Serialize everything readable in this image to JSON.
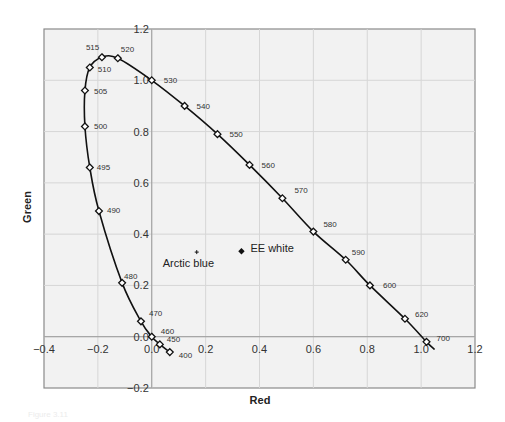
{
  "chart_data": {
    "type": "line",
    "title": "",
    "xlabel": "Red",
    "ylabel": "Green",
    "xlim": [
      -0.4,
      1.2
    ],
    "ylim": [
      -0.2,
      1.2
    ],
    "grid": true,
    "x_ticks": [
      "-0.4",
      "-0.2",
      "0.0",
      "0.2",
      "0.4",
      "0.6",
      "0.8",
      "1.0",
      "1.2"
    ],
    "y_ticks": [
      "-0.2",
      "0.0",
      "0.2",
      "0.4",
      "0.6",
      "0.8",
      "1.0",
      "1.2"
    ],
    "series": [
      {
        "name": "Spectral locus",
        "marker": "diamond-open",
        "points": [
          {
            "label": "400",
            "x": 0.067,
            "y": -0.06
          },
          {
            "label": "450",
            "x": 0.03,
            "y": -0.03
          },
          {
            "label": "460",
            "x": 0.0,
            "y": 0.0
          },
          {
            "label": "470",
            "x": -0.04,
            "y": 0.06
          },
          {
            "label": "480",
            "x": -0.11,
            "y": 0.21
          },
          {
            "label": "490",
            "x": -0.196,
            "y": 0.49
          },
          {
            "label": "495",
            "x": -0.23,
            "y": 0.66
          },
          {
            "label": "500",
            "x": -0.248,
            "y": 0.82
          },
          {
            "label": "505",
            "x": -0.248,
            "y": 0.96
          },
          {
            "label": "510",
            "x": -0.23,
            "y": 1.05
          },
          {
            "label": "515",
            "x": -0.185,
            "y": 1.09
          },
          {
            "label": "520",
            "x": -0.126,
            "y": 1.086
          },
          {
            "label": "530",
            "x": 0.0,
            "y": 1.0
          },
          {
            "label": "540",
            "x": 0.122,
            "y": 0.9
          },
          {
            "label": "550",
            "x": 0.244,
            "y": 0.79
          },
          {
            "label": "560",
            "x": 0.363,
            "y": 0.67
          },
          {
            "label": "570",
            "x": 0.485,
            "y": 0.54
          },
          {
            "label": "580",
            "x": 0.6,
            "y": 0.41
          },
          {
            "label": "590",
            "x": 0.72,
            "y": 0.3
          },
          {
            "label": "600",
            "x": 0.81,
            "y": 0.2
          },
          {
            "label": "620",
            "x": 0.94,
            "y": 0.07
          },
          {
            "label": "700",
            "x": 1.02,
            "y": -0.02
          }
        ]
      }
    ],
    "annotations": [
      {
        "label": "EE white",
        "x": 0.333,
        "y": 0.333,
        "marker": "diamond-filled"
      },
      {
        "label": "Arctic blue",
        "x": 0.167,
        "y": 0.33,
        "marker": "plus"
      }
    ]
  },
  "caption": "Figure 3.11"
}
